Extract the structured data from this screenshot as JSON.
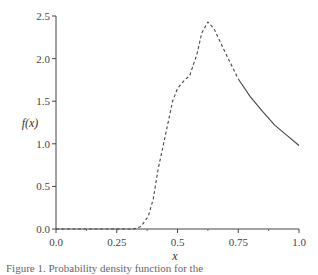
{
  "chart_data": {
    "type": "line",
    "title": "",
    "xlabel": "x",
    "ylabel": "f(x)",
    "xlim": [
      0.0,
      1.0
    ],
    "ylim": [
      0.0,
      2.5
    ],
    "grid": false,
    "legend": null,
    "x_ticks": [
      "0.0",
      "0.25",
      "0.5",
      "0.75",
      "1.0"
    ],
    "x_tick_values": [
      0.0,
      0.25,
      0.5,
      0.75,
      1.0
    ],
    "x_minor_ticks": [
      0.125,
      0.375,
      0.625,
      0.875
    ],
    "y_ticks": [
      "0.0",
      "0.5",
      "1.0",
      "1.5",
      "2.0",
      "2.5"
    ],
    "y_tick_values": [
      0.0,
      0.5,
      1.0,
      1.5,
      2.0,
      2.5
    ],
    "series": [
      {
        "name": "f(x) dashed segment",
        "style": "dashed",
        "x": [
          0.0,
          0.32,
          0.35,
          0.38,
          0.4,
          0.42,
          0.45,
          0.48,
          0.5,
          0.53,
          0.55,
          0.58,
          0.6,
          0.625,
          0.65,
          0.7,
          0.75
        ],
        "y": [
          0.0,
          0.0,
          0.03,
          0.15,
          0.35,
          0.7,
          1.1,
          1.5,
          1.65,
          1.75,
          1.8,
          2.05,
          2.3,
          2.43,
          2.35,
          2.05,
          1.76
        ]
      },
      {
        "name": "f(x) solid segment",
        "style": "solid",
        "x": [
          0.75,
          0.8,
          0.85,
          0.9,
          0.95,
          1.0
        ],
        "y": [
          1.76,
          1.55,
          1.38,
          1.22,
          1.1,
          0.98
        ]
      }
    ]
  },
  "caption": "Figure 1.   Probability density function for the"
}
